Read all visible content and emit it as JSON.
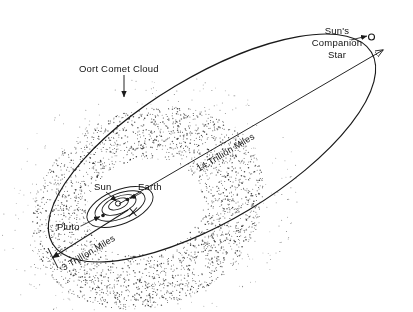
{
  "diagram": {
    "labels": {
      "oort_cloud": "Oort Comet Cloud",
      "companion_star_line1": "Sun's",
      "companion_star_line2": "Companion",
      "companion_star_line3": "Star",
      "sun": "Sun",
      "earth": "Earth",
      "pluto": "Pluto",
      "distance_inner": "3 Trillion Miles",
      "distance_outer": "14 Trillion Miles"
    },
    "colors": {
      "ink": "#1a1a1a",
      "background": "#ffffff",
      "stipple": "#2b2b2b"
    },
    "measurements": [
      {
        "name": "inner-distance",
        "value": "3 Trillion Miles",
        "from": "Sun",
        "to": "Oort cloud near edge"
      },
      {
        "name": "outer-distance",
        "value": "14 Trillion Miles",
        "from": "Sun",
        "to": "Sun's Companion Star"
      }
    ],
    "bodies": [
      {
        "name": "Sun",
        "marker": "open-circle"
      },
      {
        "name": "Earth",
        "marker": "filled-dot"
      },
      {
        "name": "Pluto",
        "marker": "filled-dot"
      },
      {
        "name": "Sun's Companion Star",
        "marker": "open-circle"
      }
    ]
  }
}
